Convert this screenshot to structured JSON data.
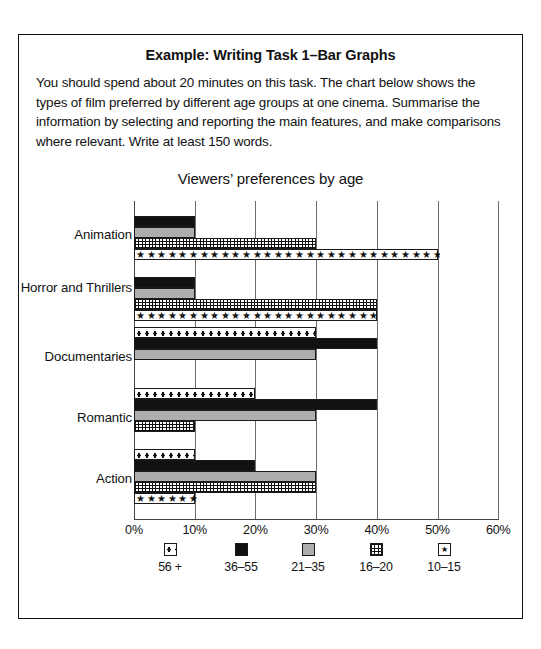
{
  "example": {
    "title": "Example: Writing Task 1–Bar Graphs",
    "prompt": "You should spend about 20 minutes on this task. The chart below shows the types of film preferred by different age groups at one cinema. Summarise the information by selecting and reporting the main features, and make comparisons where relevant. Write at least 150 words."
  },
  "chart_data": {
    "type": "bar",
    "orientation": "horizontal",
    "title": "Viewers’ preferences by age",
    "xlabel": "",
    "ylabel": "",
    "xlim": [
      0,
      60
    ],
    "xticks": [
      "0%",
      "10%",
      "20%",
      "30%",
      "40%",
      "50%",
      "60%"
    ],
    "xtick_values": [
      0,
      10,
      20,
      30,
      40,
      50,
      60
    ],
    "grid": true,
    "legend_position": "bottom",
    "categories": [
      "Animation",
      "Horror and Thrillers",
      "Documentaries",
      "Romantic",
      "Action"
    ],
    "series": [
      {
        "name": "56 +",
        "pattern": "dotted",
        "values": [
          0,
          0,
          30,
          20,
          10
        ]
      },
      {
        "name": "36–55",
        "pattern": "black",
        "values": [
          10,
          10,
          40,
          40,
          20
        ]
      },
      {
        "name": "21–35",
        "pattern": "gray",
        "values": [
          10,
          10,
          30,
          30,
          30
        ]
      },
      {
        "name": "16–20",
        "pattern": "grid",
        "values": [
          30,
          40,
          0,
          10,
          30
        ]
      },
      {
        "name": "10–15",
        "pattern": "star",
        "values": [
          50,
          40,
          0,
          0,
          10
        ]
      }
    ],
    "legend": [
      {
        "label": "56 +",
        "pattern": "dotted"
      },
      {
        "label": "36–55",
        "pattern": "black"
      },
      {
        "label": "21–35",
        "pattern": "gray"
      },
      {
        "label": "16–20",
        "pattern": "grid"
      },
      {
        "label": "10–15",
        "pattern": "star"
      }
    ]
  },
  "colors": {
    "ink": "#111111",
    "gray_fill": "#adadad",
    "gridline": "#6e6e6e",
    "background": "#ffffff"
  }
}
